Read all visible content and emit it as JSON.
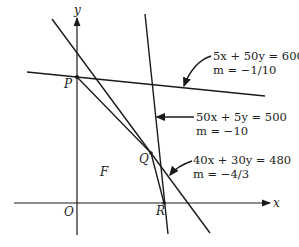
{
  "figure": {
    "type": "linear-programming-feasible-region",
    "axes": {
      "x_label": "x",
      "y_label": "y",
      "origin_label": "O"
    },
    "points": {
      "P": "P",
      "Q": "Q",
      "R": "R",
      "O": "O"
    },
    "region_label": "F",
    "constraints": [
      {
        "equation": "5x + 50y = 600",
        "slope": "m = −1/10"
      },
      {
        "equation": "50x + 5y = 500",
        "slope": "m = −10"
      },
      {
        "equation": "40x + 30y = 480",
        "slope": "m = −4/3"
      }
    ],
    "colors": {
      "line": "#1a1a1a",
      "background": "#ffffff"
    }
  }
}
